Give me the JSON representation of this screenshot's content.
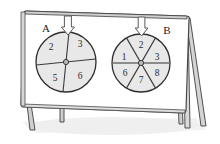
{
  "scene": {
    "title": "Two spinners on an easel board",
    "background_color": "#ffffff",
    "board_fill": "#ffffff",
    "board_stroke": "#4a4a4a",
    "frame_fill": "#d9d9d9",
    "frame_stroke": "#3f3f3f",
    "leg_fill": "#cfcfcf",
    "shadow_color": "#ececec",
    "sector_fill": "#e8e8e8",
    "sector_stroke": "#3a3a3a",
    "circle_stroke": "#2e2e2e",
    "arrow_fill": "#fefefe",
    "arrow_stroke": "#5a5a5a",
    "hub_fill": "#b9b9b9",
    "hub_stroke": "#3a3a3a",
    "number_color": "#2b2b2b",
    "label_color": "#1d1d1d"
  },
  "spinners": [
    {
      "id": "spinner-a",
      "label": "A",
      "sector_count": 4,
      "sectors": [
        {
          "value": "2",
          "position": "upper-left"
        },
        {
          "value": "3",
          "position": "upper-right"
        },
        {
          "value": "6",
          "position": "lower-right"
        },
        {
          "value": "5",
          "position": "lower-left"
        }
      ],
      "pointer": "down-arrow"
    },
    {
      "id": "spinner-b",
      "label": "B",
      "sector_count": 6,
      "sectors": [
        {
          "value": "2",
          "position": "top"
        },
        {
          "value": "3",
          "position": "upper-right"
        },
        {
          "value": "8",
          "position": "lower-right"
        },
        {
          "value": "7",
          "position": "bottom"
        },
        {
          "value": "6",
          "position": "lower-left"
        },
        {
          "value": "1",
          "position": "upper-left"
        }
      ],
      "pointer": "down-arrow"
    }
  ]
}
